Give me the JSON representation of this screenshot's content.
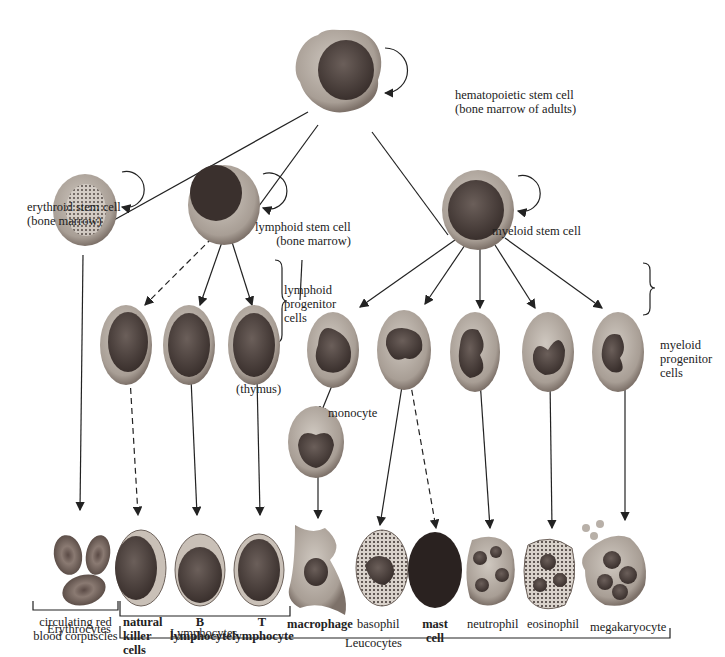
{
  "diagram": {
    "stem_cells": {
      "hematopoietic": [
        "hematopoietic stem cell",
        "(bone marrow of adults)"
      ],
      "erythroid": [
        "erythroid stem cell",
        "(bone marrow)"
      ],
      "lymphoid": [
        "lymphoid stem cell",
        "(bone marrow)"
      ],
      "myeloid": "myeloid stem cell"
    },
    "progenitors": {
      "lymphoid": [
        "lymphoid",
        "progenitor",
        "cells"
      ],
      "myeloid": [
        "myeloid",
        "progenitor",
        "cells"
      ],
      "thymus": "(thymus)",
      "monocyte": "monocyte"
    },
    "mature_cells": [
      {
        "id": "rbc",
        "label": [
          "circulating red",
          "blood corpuscles"
        ],
        "bold": false
      },
      {
        "id": "nk",
        "label": [
          "natural",
          "killer",
          "cells"
        ],
        "bold": true
      },
      {
        "id": "b",
        "label": [
          "B",
          "lymphocyte"
        ],
        "bold": true
      },
      {
        "id": "t",
        "label": [
          "T",
          "lymphocyte"
        ],
        "bold": true
      },
      {
        "id": "macrophage",
        "label": [
          "macrophage"
        ],
        "bold": true
      },
      {
        "id": "basophil",
        "label": [
          "basophil"
        ],
        "bold": false
      },
      {
        "id": "mast",
        "label": [
          "mast",
          "cell"
        ],
        "bold": true
      },
      {
        "id": "neutrophil",
        "label": [
          "neutrophil"
        ],
        "bold": false
      },
      {
        "id": "eosinophil",
        "label": [
          "eosinophil"
        ],
        "bold": false
      },
      {
        "id": "megakaryocyte",
        "label": [
          "megakaryocyte"
        ],
        "bold": false
      }
    ],
    "groups": {
      "erythrocytes": "Erythrocytes",
      "lymphocytes": "Lymphocytes",
      "leucocytes": "Leucocytes"
    },
    "colors": {
      "cytoplasm": "#b8b0a8",
      "cytoplasm_dark": "#8f857c",
      "nucleus": "#4a3f3c",
      "line": "#222222"
    }
  }
}
